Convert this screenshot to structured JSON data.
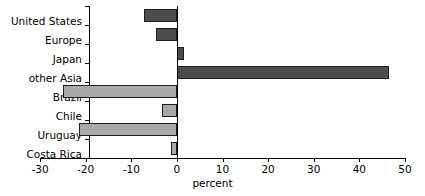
{
  "chart_data": {
    "type": "bar",
    "orientation": "horizontal",
    "title": "",
    "xlabel": "percent",
    "ylabel": "",
    "xlim": [
      -30,
      50
    ],
    "xticks": [
      -30,
      -20,
      -10,
      0,
      10,
      20,
      30,
      40,
      50
    ],
    "xticklabels": [
      "-30",
      "-20",
      "-10",
      "0",
      "10",
      "20",
      "30",
      "40",
      "50"
    ],
    "grid": false,
    "legend": false,
    "zero_reference_line": true,
    "categories": [
      "United States",
      "Europe",
      "Japan",
      "other Asia",
      "Brazil",
      "Chile",
      "Uruguay",
      "Costa Rica"
    ],
    "values": [
      -7.3,
      -4.5,
      1.5,
      46.5,
      -25.0,
      -3.3,
      -21.5,
      -1.3
    ],
    "bar_colors": [
      "#4d4d4d",
      "#4d4d4d",
      "#4d4d4d",
      "#4d4d4d",
      "#a9a9a9",
      "#a9a9a9",
      "#a9a9a9",
      "#a9a9a9"
    ],
    "bar_edge_color": "#1e1e1e",
    "axis_color": "#000000",
    "background": "#ffffff"
  }
}
